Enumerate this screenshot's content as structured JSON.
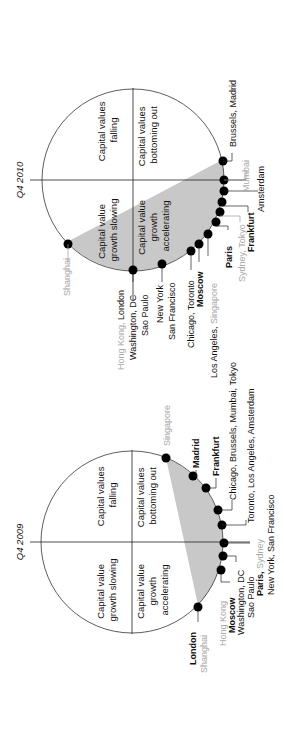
{
  "diagrams": [
    {
      "title": "Q4 2010",
      "quadrants": {
        "top_left": [
          "Capital value",
          "growth slowing"
        ],
        "top_right": [
          "Capital values",
          "falling"
        ],
        "bottom_left": [
          "Capital value",
          "growth",
          "accelerating"
        ],
        "bottom_right": [
          "Capital values",
          "bottoming out"
        ]
      },
      "labels": [
        {
          "text": "Shanghai",
          "grey": true
        },
        {
          "text": "Hong Kong, ",
          "grey": true,
          "suffix": "London"
        },
        {
          "text": "Washington, DC"
        },
        {
          "text": "Sao Paulo"
        },
        {
          "text": "New York"
        },
        {
          "text": "San Francisco"
        },
        {
          "text": "Chicago, Toronto"
        },
        {
          "text": "Moscow"
        },
        {
          "text": "Los Angeles, ",
          "suffix_grey": "Singapore"
        },
        {
          "text": "Paris"
        },
        {
          "text": "Sydney, Tokyo",
          "grey": true
        },
        {
          "text": "Frankfurt"
        },
        {
          "text": "Amsterdam"
        },
        {
          "text": "Mumbai",
          "grey": true
        },
        {
          "text": "Brussels, Madrid"
        }
      ]
    },
    {
      "title": "Q4 2009",
      "quadrants": {
        "top_left": [
          "Capital value",
          "growth slowing"
        ],
        "top_right": [
          "Capital values",
          "falling"
        ],
        "bottom_left": [
          "Capital value",
          "growth",
          "accelerating"
        ],
        "bottom_right": [
          "Capital values",
          "bottoming out"
        ]
      },
      "labels": [
        {
          "text": "London"
        },
        {
          "text": "Shanghai",
          "grey": true
        },
        {
          "text": "Hong Kong",
          "grey": true
        },
        {
          "text": "Moscow"
        },
        {
          "text": "Washington, DC"
        },
        {
          "text": "Sao Paulo"
        },
        {
          "text": "Paris, ",
          "suffix_grey": "Sydney"
        },
        {
          "text": "New York, San Francisco"
        },
        {
          "text": "Toronto, Los Angeles, Amsterdam"
        },
        {
          "text": "Chicago, Brussels, Mumbai, Tokyo"
        },
        {
          "text": "Frankfurt"
        },
        {
          "text": "Madrid"
        },
        {
          "text": "Singapore",
          "grey": true
        }
      ]
    }
  ]
}
